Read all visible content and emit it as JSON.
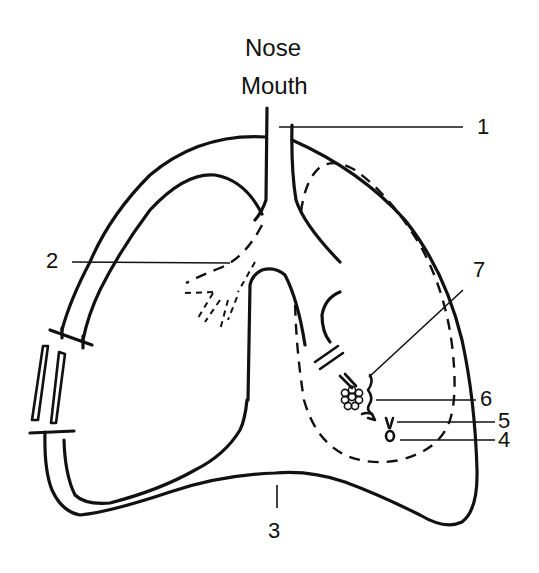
{
  "diagram": {
    "type": "respiratory-system-schematic",
    "top_label": {
      "line1": "Nose",
      "line2": "Mouth"
    },
    "callouts": [
      {
        "id": "1",
        "label": "1",
        "points_to": "trachea"
      },
      {
        "id": "2",
        "label": "2",
        "points_to": "bronchus"
      },
      {
        "id": "3",
        "label": "3",
        "points_to": "diaphragm"
      },
      {
        "id": "4",
        "label": "4",
        "points_to": "small structure (bulb)"
      },
      {
        "id": "5",
        "label": "5",
        "points_to": "small structure (stem)"
      },
      {
        "id": "6",
        "label": "6",
        "points_to": "bronchiole"
      },
      {
        "id": "7",
        "label": "7",
        "points_to": "alveoli cluster"
      }
    ],
    "colors": {
      "stroke": "#111111",
      "background": "#ffffff"
    }
  }
}
